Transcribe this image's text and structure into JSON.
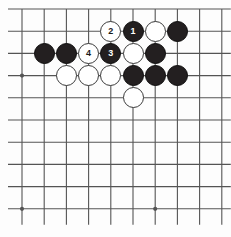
{
  "board": {
    "kind": "go-board-diagram",
    "title": "Go problem diagram",
    "cols": 10,
    "rows": 10,
    "origin_x": 22,
    "origin_y": 9,
    "spacing": 22.2,
    "stone_diameter": 21,
    "line_color": "#545454",
    "board_color": "#fdfdfd",
    "black_color": "#231f20",
    "white_color": "#ffffff",
    "edge_top_label": "",
    "star_points": [
      {
        "col": 0,
        "row": 3
      },
      {
        "col": 0,
        "row": 9
      },
      {
        "col": 6,
        "row": 9
      }
    ],
    "stones": [
      {
        "col": 4,
        "row": 1,
        "color": "white",
        "label": "2",
        "name": "stone-white-2"
      },
      {
        "col": 5,
        "row": 1,
        "color": "black",
        "label": "1",
        "name": "stone-black-1"
      },
      {
        "col": 6,
        "row": 1,
        "color": "white",
        "label": "",
        "name": "stone-white"
      },
      {
        "col": 7,
        "row": 1,
        "color": "black",
        "label": "",
        "name": "stone-black"
      },
      {
        "col": 1,
        "row": 2,
        "color": "black",
        "label": "",
        "name": "stone-black"
      },
      {
        "col": 2,
        "row": 2,
        "color": "black",
        "label": "",
        "name": "stone-black"
      },
      {
        "col": 3,
        "row": 2,
        "color": "white",
        "label": "4",
        "name": "stone-white-4"
      },
      {
        "col": 4,
        "row": 2,
        "color": "black",
        "label": "3",
        "name": "stone-black-3"
      },
      {
        "col": 5,
        "row": 2,
        "color": "white",
        "label": "",
        "name": "stone-white"
      },
      {
        "col": 6,
        "row": 2,
        "color": "black",
        "label": "",
        "name": "stone-black"
      },
      {
        "col": 2,
        "row": 3,
        "color": "white",
        "label": "",
        "name": "stone-white"
      },
      {
        "col": 3,
        "row": 3,
        "color": "white",
        "label": "",
        "name": "stone-white"
      },
      {
        "col": 4,
        "row": 3,
        "color": "white",
        "label": "",
        "name": "stone-white"
      },
      {
        "col": 5,
        "row": 3,
        "color": "black",
        "label": "",
        "name": "stone-black"
      },
      {
        "col": 6,
        "row": 3,
        "color": "black",
        "label": "",
        "name": "stone-black"
      },
      {
        "col": 7,
        "row": 3,
        "color": "black",
        "label": "",
        "name": "stone-black"
      },
      {
        "col": 5,
        "row": 4,
        "color": "white",
        "label": "",
        "name": "stone-white"
      }
    ],
    "move_sequence": [
      {
        "number": "1",
        "color": "black"
      },
      {
        "number": "2",
        "color": "white"
      },
      {
        "number": "3",
        "color": "black"
      },
      {
        "number": "4",
        "color": "white"
      }
    ]
  }
}
